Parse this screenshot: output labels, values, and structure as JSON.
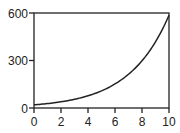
{
  "chart_data": {
    "type": "line",
    "title": "",
    "xlabel": "",
    "ylabel": "",
    "xlim": [
      0,
      10
    ],
    "ylim": [
      0,
      600
    ],
    "grid": false,
    "legend": null,
    "x_ticks": [
      0,
      2,
      4,
      6,
      8,
      10
    ],
    "x_tick_labels": [
      "0",
      "2",
      "4",
      "6",
      "8",
      "10"
    ],
    "y_ticks": [
      0,
      300,
      600
    ],
    "y_tick_labels": [
      "0",
      "300",
      "600"
    ],
    "series": [
      {
        "name": "curve",
        "color": "#222222",
        "x": [
          0,
          1,
          2,
          3,
          4,
          5,
          6,
          7,
          8,
          9,
          10
        ],
        "values": [
          20,
          28,
          39,
          55,
          77,
          108,
          152,
          213,
          298,
          418,
          586
        ]
      }
    ]
  },
  "style": {
    "axis_color": "#222222",
    "line_color": "#222222",
    "background": "#ffffff"
  }
}
